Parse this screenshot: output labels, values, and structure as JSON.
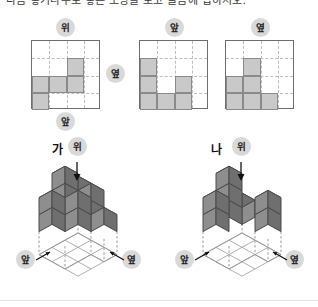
{
  "question": {
    "text": "다음 쌓기나무로 쌓은 모양을 보고 물음에 답하시오."
  },
  "views": {
    "top_label": "위",
    "front_label": "앞",
    "side_label": "옆",
    "grids": [
      {
        "name": "top-view-grid",
        "label": "위",
        "label_position": "above",
        "secondary_label": "옆",
        "secondary_label_position": "right",
        "tertiary_label": "앞",
        "tertiary_label_position": "below",
        "rows": 4,
        "cols": 4,
        "filled_cells": [
          {
            "row": 2,
            "col": 3
          },
          {
            "row": 3,
            "col": 1
          },
          {
            "row": 3,
            "col": 2
          },
          {
            "row": 3,
            "col": 3
          },
          {
            "row": 4,
            "col": 1
          }
        ]
      },
      {
        "name": "front-view-grid",
        "label": "앞",
        "label_position": "above",
        "rows": 4,
        "cols": 4,
        "filled_cells": [
          {
            "row": 2,
            "col": 1
          },
          {
            "row": 3,
            "col": 1
          },
          {
            "row": 3,
            "col": 3
          },
          {
            "row": 4,
            "col": 1
          },
          {
            "row": 4,
            "col": 2
          },
          {
            "row": 4,
            "col": 3
          }
        ]
      },
      {
        "name": "side-view-grid",
        "label": "옆",
        "label_position": "above",
        "rows": 4,
        "cols": 4,
        "filled_cells": [
          {
            "row": 2,
            "col": 2
          },
          {
            "row": 3,
            "col": 1
          },
          {
            "row": 3,
            "col": 2
          },
          {
            "row": 4,
            "col": 1
          },
          {
            "row": 4,
            "col": 2
          },
          {
            "row": 4,
            "col": 3
          }
        ]
      }
    ]
  },
  "figures": [
    {
      "name": "figure-ga",
      "title": "가",
      "top_label": "위",
      "front_label": "앞",
      "side_label": "옆"
    },
    {
      "name": "figure-na",
      "title": "나",
      "top_label": "위",
      "front_label": "앞",
      "side_label": "옆"
    }
  ],
  "colors": {
    "cube_top": "#b8b8b8",
    "cube_left": "#8e8e8e",
    "cube_right": "#6f6f6f",
    "cube_edge": "#4a4a4a",
    "grid_fill": "#c9c9c9",
    "grid_fill_edge": "#8a8a8a",
    "grid_border": "#6e6e6e",
    "grid_dash": "#bdbdbd",
    "pill_bg": "#d9d9d9",
    "base_dash": "#9a9a9a"
  }
}
